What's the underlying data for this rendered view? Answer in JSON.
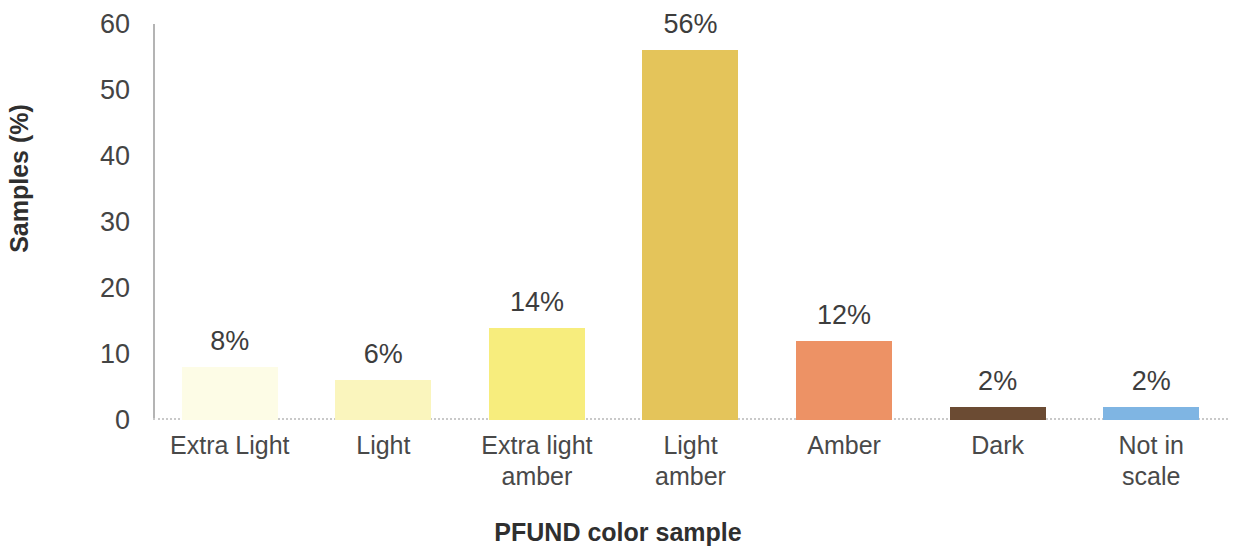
{
  "chart_data": {
    "type": "bar",
    "title": "",
    "xlabel": "PFUND color sample",
    "ylabel": "Samples (%)",
    "categories": [
      "Extra Light",
      "Light",
      "Extra light amber",
      "Light amber",
      "Amber",
      "Dark",
      "Not in scale"
    ],
    "category_lines": [
      [
        "Extra Light"
      ],
      [
        "Light"
      ],
      [
        "Extra light",
        "amber"
      ],
      [
        "Light",
        "amber"
      ],
      [
        "Amber"
      ],
      [
        "Dark"
      ],
      [
        "Not in",
        "scale"
      ]
    ],
    "values": [
      8,
      6,
      14,
      56,
      12,
      2,
      2
    ],
    "data_labels": [
      "8%",
      "6%",
      "14%",
      "56%",
      "12%",
      "2%",
      "2%"
    ],
    "bar_colors": [
      "#fdfce6",
      "#faf5bd",
      "#f7ed7d",
      "#e4c45a",
      "#ed9265",
      "#6b4b33",
      "#7fb5e3"
    ],
    "ylim": [
      0,
      60
    ],
    "ytick_values": [
      60,
      50,
      40,
      30,
      20,
      10,
      0
    ],
    "ytick_labels": [
      "60",
      "50",
      "40",
      "30",
      "20",
      "10",
      "0"
    ],
    "grid": false,
    "legend": false,
    "axis_color": "#b4b4b4",
    "baseline_color": "#c9c9c9",
    "text_color": "#3b3b3b"
  }
}
